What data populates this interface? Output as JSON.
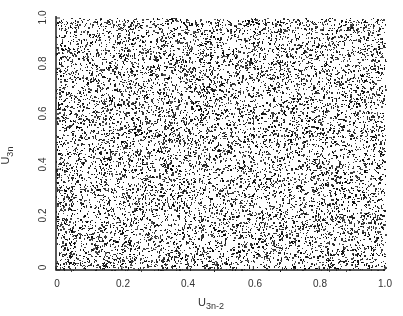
{
  "chart_data": {
    "type": "scatter",
    "title": "",
    "xlabel": "U_{3n-2}",
    "ylabel": "U_{3n}",
    "xlim": [
      0,
      1.0
    ],
    "ylim": [
      0,
      1.0
    ],
    "x_ticks": [
      "0",
      "0.2",
      "0.4",
      "0.6",
      "0.8",
      "1.0"
    ],
    "y_ticks": [
      "0",
      "0.2",
      "0.4",
      "0.6",
      "0.8",
      "1.0"
    ],
    "grid": false,
    "legend": null,
    "point_count_estimate": 30000,
    "distribution": "uniform"
  },
  "axis": {
    "x_label_main": "U",
    "x_label_sub": "3n-2",
    "y_label_main": "U",
    "y_label_sub": "3n"
  }
}
